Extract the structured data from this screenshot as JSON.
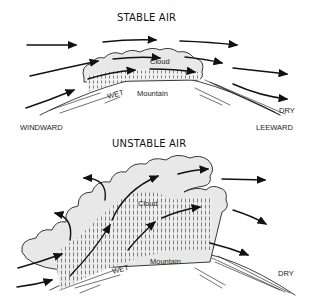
{
  "panels": [
    {
      "title": "STABLE AIR",
      "labels": {
        "cloud": "Cloud",
        "mountain": "Mountain",
        "wet": "WET",
        "dry": "DRY",
        "windward": "WINDWARD",
        "leeward": "LEEWARD"
      }
    },
    {
      "title": "UNSTABLE AIR",
      "labels": {
        "cloud": "Cloud",
        "mountain": "Mountain",
        "wet": "WET",
        "dry": "DRY"
      }
    }
  ]
}
